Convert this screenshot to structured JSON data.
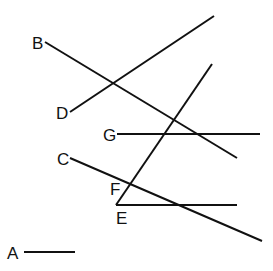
{
  "diagram": {
    "stroke_color": "#111111",
    "background": "#ffffff",
    "segments": [
      {
        "id": "B",
        "label": "B",
        "x1": 45,
        "y1": 42,
        "x2": 237,
        "y2": 158,
        "lx": 32,
        "ly": 35
      },
      {
        "id": "D",
        "label": "D",
        "x1": 70,
        "y1": 112,
        "x2": 214,
        "y2": 16,
        "lx": 56,
        "ly": 105
      },
      {
        "id": "G",
        "label": "G",
        "x1": 117,
        "y1": 134,
        "x2": 260,
        "y2": 134,
        "lx": 103,
        "ly": 127
      },
      {
        "id": "C",
        "label": "C",
        "x1": 70,
        "y1": 158,
        "x2": 262,
        "y2": 241,
        "lx": 57,
        "ly": 151
      },
      {
        "id": "F",
        "label": "F",
        "x1": 116,
        "y1": 205,
        "x2": 212,
        "y2": 64,
        "lx": 110,
        "ly": 181
      },
      {
        "id": "E",
        "label": "E",
        "x1": 116,
        "y1": 205,
        "x2": 237,
        "y2": 205,
        "lx": 116,
        "ly": 210
      },
      {
        "id": "A",
        "label": "A",
        "x1": 24,
        "y1": 252,
        "x2": 75,
        "y2": 252,
        "lx": 7,
        "ly": 245
      }
    ]
  }
}
